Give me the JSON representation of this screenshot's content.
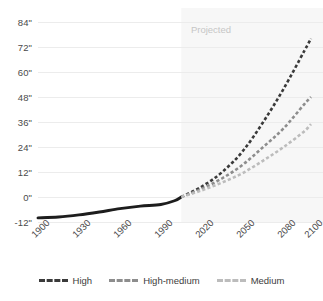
{
  "chart_data": {
    "type": "line",
    "title": "",
    "xlabel": "",
    "ylabel": "",
    "xlim": [
      1900,
      2100
    ],
    "ylim": [
      -12,
      84
    ],
    "grid": true,
    "legend_position": "bottom",
    "x_ticks": [
      "1900",
      "1930",
      "1960",
      "1990",
      "2020",
      "2050",
      "2080",
      "2100"
    ],
    "x_tick_values": [
      1900,
      1930,
      1960,
      1990,
      2020,
      2050,
      2080,
      2100
    ],
    "y_ticks": [
      "-12\"",
      "0\"",
      "12\"",
      "24\"",
      "36\"",
      "48\"",
      "60\"",
      "72\"",
      "84\""
    ],
    "y_tick_values": [
      -12,
      0,
      12,
      24,
      36,
      48,
      60,
      72,
      84
    ],
    "annotations": [
      {
        "text": "Projected",
        "x": 2012,
        "y": 80
      }
    ],
    "shaded_region": {
      "label": "Projected",
      "x_start": 2005,
      "x_end": 2100,
      "color": "#f7f7f7"
    },
    "series": [
      {
        "name": "Observed",
        "style": "solid",
        "color": "#1d1d1d",
        "show_in_legend": false,
        "x": [
          1900,
          1915,
          1930,
          1945,
          1960,
          1975,
          1990,
          2000,
          2005
        ],
        "values": [
          -10.0,
          -9.6,
          -8.6,
          -7.2,
          -5.6,
          -4.4,
          -3.6,
          -1.8,
          0.0
        ]
      },
      {
        "name": "High",
        "style": "dashed",
        "color": "#3a3a3a",
        "show_in_legend": true,
        "x": [
          2005,
          2020,
          2035,
          2050,
          2065,
          2080,
          2095,
          2100
        ],
        "values": [
          0.0,
          5.0,
          12.0,
          22.0,
          36.0,
          52.0,
          70.0,
          76.0
        ]
      },
      {
        "name": "High-medium",
        "style": "dashed",
        "color": "#8d8d8d",
        "show_in_legend": true,
        "x": [
          2005,
          2020,
          2035,
          2050,
          2065,
          2080,
          2095,
          2100
        ],
        "values": [
          0.0,
          4.0,
          9.0,
          15.5,
          24.0,
          33.0,
          44.5,
          48.0
        ]
      },
      {
        "name": "Medium",
        "style": "dashed",
        "color": "#bcbcbc",
        "show_in_legend": true,
        "x": [
          2005,
          2020,
          2035,
          2050,
          2065,
          2080,
          2095,
          2100
        ],
        "values": [
          0.0,
          3.2,
          7.0,
          11.5,
          17.5,
          24.0,
          31.5,
          35.0
        ]
      }
    ]
  },
  "legend": {
    "items": [
      {
        "label": "High",
        "color": "#3a3a3a"
      },
      {
        "label": "High-medium",
        "color": "#8d8d8d"
      },
      {
        "label": "Medium",
        "color": "#bcbcbc"
      }
    ]
  },
  "colors": {
    "grid": "#ececec",
    "axis_text": "#4a4a4a",
    "projected_band": "#f7f7f7",
    "projected_text": "#c6c6c6",
    "background": "#ffffff"
  }
}
